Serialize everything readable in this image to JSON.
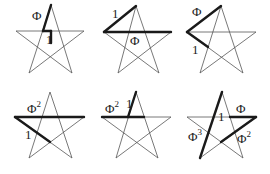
{
  "colors": {
    "line": "#555555",
    "highlight": "#1a1a1a",
    "background": "#ffffff"
  },
  "panels": [
    {
      "id": "p1",
      "labels": [
        {
          "text": "Φ",
          "sup": ""
        },
        {
          "text": "1",
          "sup": ""
        }
      ]
    },
    {
      "id": "p2",
      "labels": [
        {
          "text": "1",
          "sup": ""
        },
        {
          "text": "Φ",
          "sup": ""
        }
      ]
    },
    {
      "id": "p3",
      "labels": [
        {
          "text": "Φ",
          "sup": ""
        },
        {
          "text": "1",
          "sup": ""
        }
      ]
    },
    {
      "id": "p4",
      "labels": [
        {
          "text": "Φ",
          "sup": "2"
        },
        {
          "text": "1",
          "sup": ""
        }
      ]
    },
    {
      "id": "p5",
      "labels": [
        {
          "text": "Φ",
          "sup": "2"
        },
        {
          "text": "1",
          "sup": ""
        }
      ]
    },
    {
      "id": "p6",
      "labels": [
        {
          "text": "1",
          "sup": ""
        },
        {
          "text": "Φ",
          "sup": ""
        },
        {
          "text": "Φ",
          "sup": "3"
        },
        {
          "text": "Φ",
          "sup": "2"
        }
      ]
    }
  ]
}
